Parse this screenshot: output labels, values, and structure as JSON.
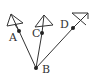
{
  "diagram": {
    "colors": {
      "stroke": "#333333",
      "background": "#ffffff"
    },
    "points": {
      "A": {
        "label": "A",
        "x": 19,
        "y": 31
      },
      "B": {
        "label": "B",
        "x": 36,
        "y": 68
      },
      "C": {
        "label": "C",
        "x": 42,
        "y": 33
      },
      "D": {
        "label": "D",
        "x": 73,
        "y": 28
      }
    },
    "segments": [
      "AB",
      "CB",
      "DB"
    ],
    "kites": [
      {
        "name": "kite-A",
        "attached_to": "A"
      },
      {
        "name": "kite-C",
        "attached_to": "C"
      },
      {
        "name": "kite-D",
        "attached_to": "D"
      }
    ]
  }
}
